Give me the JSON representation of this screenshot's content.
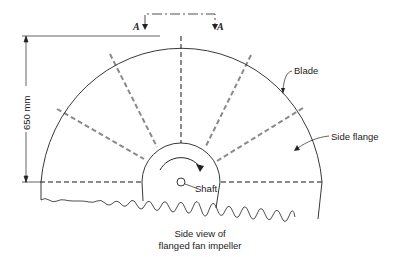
{
  "figure": {
    "caption_line1": "Side view of",
    "caption_line2": "flanged fan impeller"
  },
  "labels": {
    "dimension": "650 mm",
    "blade": "Blade",
    "side_flange": "Side flange",
    "shaft": "Shaft",
    "section_left": "A",
    "section_right": "A"
  },
  "colors": {
    "line": "#222222",
    "blade_dash": "#8a8a8a",
    "background": "#ffffff"
  }
}
